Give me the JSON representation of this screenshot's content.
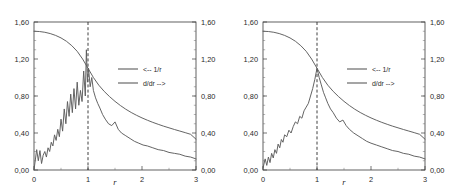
{
  "figure": {
    "panel_count": 2,
    "background_color": "#ffffff",
    "line_color": "#5c5c5c",
    "axis_color": "#3a3a3a",
    "text_color": "#2b2b2b"
  },
  "chart_data": [
    {
      "type": "line",
      "title": "",
      "subtitle": "",
      "xlabel": "r",
      "ylabel": "",
      "y2label": "",
      "xlim": [
        0,
        3
      ],
      "ylim": [
        0,
        1.6
      ],
      "y2lim": [
        0,
        1.6
      ],
      "grid": false,
      "legend_position": "center-right",
      "xticks": [
        0,
        1,
        2,
        3
      ],
      "xticklabels": [
        "0",
        "1",
        "2",
        "3"
      ],
      "yticks": [
        0.0,
        0.4,
        0.8,
        1.2,
        1.6
      ],
      "yticklabels": [
        "0,00",
        "0,40",
        "0,80",
        "1,20",
        "1,60"
      ],
      "y2ticks": [
        0.0,
        0.4,
        0.8,
        1.2,
        1.6
      ],
      "y2ticklabels": [
        "0,00",
        "0,40",
        "0,80",
        "1,20",
        "1,60"
      ],
      "annotations": [
        {
          "type": "vertical-dashed-line",
          "x": 1.0,
          "label": ""
        }
      ],
      "series": [
        {
          "name": "<-- 1/r",
          "axis": "left",
          "style": "smooth",
          "x": [
            0.0,
            0.1,
            0.2,
            0.3,
            0.4,
            0.5,
            0.6,
            0.7,
            0.8,
            0.9,
            1.0,
            1.1,
            1.2,
            1.3,
            1.4,
            1.5,
            1.6,
            1.7,
            1.8,
            1.9,
            2.0,
            2.1,
            2.2,
            2.3,
            2.4,
            2.5,
            2.6,
            2.7,
            2.8,
            2.9,
            3.0
          ],
          "values": [
            1.5,
            1.497,
            1.489,
            1.475,
            1.455,
            1.428,
            1.392,
            1.344,
            1.283,
            1.2,
            1.1,
            1.0,
            0.917,
            0.85,
            0.793,
            0.742,
            0.697,
            0.657,
            0.622,
            0.591,
            0.563,
            0.538,
            0.515,
            0.494,
            0.474,
            0.456,
            0.438,
            0.421,
            0.404,
            0.386,
            0.333
          ]
        },
        {
          "name": "d/dr -->",
          "axis": "right",
          "style": "noisy",
          "noise_level": "high",
          "x": [
            0.0,
            0.05,
            0.08,
            0.11,
            0.14,
            0.17,
            0.2,
            0.23,
            0.26,
            0.29,
            0.32,
            0.35,
            0.38,
            0.41,
            0.44,
            0.47,
            0.5,
            0.53,
            0.56,
            0.59,
            0.62,
            0.65,
            0.68,
            0.71,
            0.74,
            0.77,
            0.8,
            0.83,
            0.86,
            0.89,
            0.92,
            0.95,
            0.97,
            0.99,
            1.01,
            1.04,
            1.07,
            1.1,
            1.14,
            1.18,
            1.22,
            1.27,
            1.32,
            1.38,
            1.44,
            1.5,
            1.56,
            1.62,
            1.7,
            1.78,
            1.86,
            1.94,
            2.02,
            2.1,
            2.2,
            2.3,
            2.4,
            2.5,
            2.6,
            2.7,
            2.8,
            2.9,
            3.0
          ],
          "values": [
            0.0,
            0.22,
            0.1,
            0.21,
            0.07,
            0.16,
            0.2,
            0.14,
            0.24,
            0.2,
            0.3,
            0.26,
            0.38,
            0.32,
            0.44,
            0.36,
            0.55,
            0.42,
            0.66,
            0.5,
            0.74,
            0.58,
            0.82,
            0.62,
            0.88,
            0.66,
            0.95,
            0.7,
            0.86,
            0.74,
            1.07,
            0.8,
            1.3,
            0.95,
            1.1,
            0.9,
            1.0,
            0.86,
            0.78,
            0.72,
            0.67,
            0.6,
            0.55,
            0.5,
            0.48,
            0.52,
            0.44,
            0.4,
            0.37,
            0.34,
            0.31,
            0.29,
            0.27,
            0.26,
            0.24,
            0.22,
            0.21,
            0.19,
            0.18,
            0.17,
            0.15,
            0.14,
            0.12
          ]
        }
      ]
    },
    {
      "type": "line",
      "title": "",
      "subtitle": "",
      "xlabel": "r",
      "ylabel": "",
      "y2label": "",
      "xlim": [
        0,
        3
      ],
      "ylim": [
        0,
        1.6
      ],
      "y2lim": [
        0,
        1.6
      ],
      "grid": false,
      "legend_position": "center-right",
      "xticks": [
        0,
        1,
        2,
        3
      ],
      "xticklabels": [
        "0",
        "1",
        "2",
        "3"
      ],
      "yticks": [
        0.0,
        0.4,
        0.8,
        1.2,
        1.6
      ],
      "yticklabels": [
        "0,00",
        "0,40",
        "0,80",
        "1,20",
        "1,60"
      ],
      "y2ticks": [
        0.0,
        0.4,
        0.8,
        1.2,
        1.6
      ],
      "y2ticklabels": [
        "0,00",
        "0,40",
        "0,80",
        "1,20",
        "1,60"
      ],
      "annotations": [
        {
          "type": "vertical-dashed-line",
          "x": 1.0,
          "label": ""
        }
      ],
      "series": [
        {
          "name": "<-- 1/r",
          "axis": "left",
          "style": "smooth",
          "x": [
            0.0,
            0.1,
            0.2,
            0.3,
            0.4,
            0.5,
            0.6,
            0.7,
            0.8,
            0.9,
            1.0,
            1.1,
            1.2,
            1.3,
            1.4,
            1.5,
            1.6,
            1.7,
            1.8,
            1.9,
            2.0,
            2.1,
            2.2,
            2.3,
            2.4,
            2.5,
            2.6,
            2.7,
            2.8,
            2.9,
            3.0
          ],
          "values": [
            1.5,
            1.497,
            1.489,
            1.475,
            1.455,
            1.428,
            1.392,
            1.344,
            1.283,
            1.2,
            1.1,
            1.0,
            0.917,
            0.85,
            0.793,
            0.742,
            0.697,
            0.657,
            0.622,
            0.591,
            0.563,
            0.538,
            0.515,
            0.494,
            0.474,
            0.456,
            0.438,
            0.421,
            0.404,
            0.386,
            0.333
          ]
        },
        {
          "name": "d/dr -->",
          "axis": "right",
          "style": "noisy",
          "noise_level": "low",
          "x": [
            0.0,
            0.04,
            0.07,
            0.1,
            0.13,
            0.16,
            0.19,
            0.22,
            0.25,
            0.28,
            0.31,
            0.34,
            0.37,
            0.4,
            0.44,
            0.48,
            0.52,
            0.56,
            0.6,
            0.64,
            0.68,
            0.72,
            0.76,
            0.8,
            0.84,
            0.88,
            0.92,
            0.96,
            1.0,
            1.04,
            1.08,
            1.12,
            1.16,
            1.2,
            1.25,
            1.3,
            1.36,
            1.42,
            1.48,
            1.54,
            1.6,
            1.68,
            1.76,
            1.84,
            1.92,
            2.0,
            2.1,
            2.2,
            2.3,
            2.4,
            2.5,
            2.6,
            2.7,
            2.8,
            2.9,
            3.0
          ],
          "values": [
            0.02,
            0.12,
            0.05,
            0.14,
            0.08,
            0.18,
            0.13,
            0.22,
            0.18,
            0.28,
            0.24,
            0.33,
            0.3,
            0.38,
            0.36,
            0.43,
            0.4,
            0.47,
            0.52,
            0.5,
            0.58,
            0.56,
            0.64,
            0.68,
            0.72,
            0.8,
            0.88,
            0.98,
            1.1,
            1.0,
            0.92,
            0.84,
            0.78,
            0.72,
            0.66,
            0.62,
            0.56,
            0.52,
            0.54,
            0.48,
            0.44,
            0.4,
            0.37,
            0.34,
            0.31,
            0.29,
            0.27,
            0.25,
            0.23,
            0.21,
            0.2,
            0.18,
            0.17,
            0.15,
            0.14,
            0.12
          ]
        }
      ]
    }
  ]
}
